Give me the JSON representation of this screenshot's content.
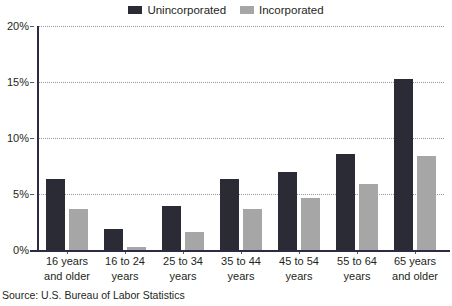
{
  "chart_data": {
    "type": "bar",
    "title": "",
    "xlabel": "",
    "ylabel": "",
    "ylim": [
      0,
      20
    ],
    "ytick_values": [
      20,
      15,
      10,
      5,
      0
    ],
    "ytick_labels": [
      "20%",
      "15%",
      "10%",
      "5%",
      "0%"
    ],
    "grid": true,
    "legend_position": "top-center",
    "categories": [
      "16 years and older",
      "16 to 24 years",
      "25 to 34 years",
      "35 to 44 years",
      "45 to 54 years",
      "55 to 64 years",
      "65 years and older"
    ],
    "category_lines": [
      [
        "16 years",
        "and older"
      ],
      [
        "16 to 24",
        "years"
      ],
      [
        "25 to 34",
        "years"
      ],
      [
        "35 to 44",
        "years"
      ],
      [
        "45 to 54",
        "years"
      ],
      [
        "55 to 64",
        "years"
      ],
      [
        "65 years",
        "and older"
      ]
    ],
    "series": [
      {
        "name": "Unincorporated",
        "color": "#2b2b35",
        "values": [
          6.3,
          1.9,
          3.9,
          6.3,
          7.0,
          8.6,
          15.3
        ]
      },
      {
        "name": "Incorporated",
        "color": "#a6a6a6",
        "values": [
          3.7,
          0.3,
          1.6,
          3.7,
          4.6,
          5.9,
          8.4
        ]
      }
    ],
    "source_note": "Source: U.S. Bureau of Labor Statistics",
    "axis_color": "#2b2b45",
    "gridline_color": "#9b9b9f"
  },
  "legend": {
    "items": [
      {
        "label": "Unincorporated",
        "color": "#2b2b35",
        "icon": "square-swatch-dark"
      },
      {
        "label": "Incorporated",
        "color": "#a6a6a6",
        "icon": "square-swatch-gray"
      }
    ]
  },
  "source": {
    "text": "Source: U.S. Bureau of Labor Statistics"
  }
}
